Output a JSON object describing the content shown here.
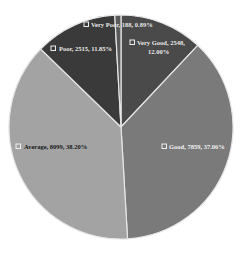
{
  "chart_data": {
    "type": "pie",
    "title": "",
    "start_angle_deg": 0,
    "direction": "clockwise",
    "slices": [
      {
        "label": "Very Good",
        "value": 2548,
        "percent": "12.00%",
        "color": "#4a4a4a",
        "text": "Very Good, 2548,",
        "text2": "12.00%"
      },
      {
        "label": "Good",
        "value": 7859,
        "percent": "37.06%",
        "color": "#7a7a7a",
        "text": "Good, 7859, 37.06%",
        "text2": ""
      },
      {
        "label": "Average",
        "value": 8099,
        "percent": "38.20%",
        "color": "#a3a3a3",
        "text": "Average, 8099, 38.20%",
        "text2": ""
      },
      {
        "label": "Poor",
        "value": 2515,
        "percent": "11.85%",
        "color": "#3a3a3a",
        "text": "Poor, 2515, 11.85%",
        "text2": ""
      },
      {
        "label": "Very Poor",
        "value": 188,
        "percent": "0.89%",
        "color": "#5a5a5a",
        "text": "Very Poor, 188, 0.89%",
        "text2": ""
      }
    ],
    "legend": "none (data labels on slices)",
    "label_format": "category, value, percent"
  }
}
